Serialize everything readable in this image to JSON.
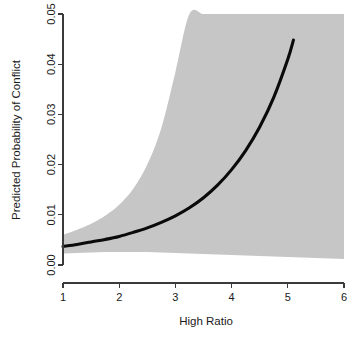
{
  "chart_data": {
    "type": "line",
    "title": "",
    "subtitle": "",
    "xlabel": "High Ratio",
    "ylabel": "Predicted Probability of Conflict",
    "xlim": [
      1,
      6
    ],
    "ylim": [
      0,
      0.05
    ],
    "grid": false,
    "legend": null,
    "legend_position": "none",
    "xticks": [
      1,
      2,
      3,
      4,
      5,
      6
    ],
    "xtick_labels": [
      "1",
      "2",
      "3",
      "4",
      "5",
      "6"
    ],
    "yticks": [
      0.0,
      0.01,
      0.02,
      0.03,
      0.04,
      0.05
    ],
    "ytick_labels": [
      "0.00",
      "0.01",
      "0.02",
      "0.03",
      "0.04",
      "0.05"
    ],
    "ytick_label_rotation": -90,
    "colors": {
      "line": "#0a0a0a",
      "band": "#c6c6c6",
      "axis": "#3a3a3a",
      "text": "#1a1a1a",
      "background": "#ffffff"
    },
    "series": [
      {
        "name": "Predicted probability",
        "type": "line",
        "x": [
          1.0,
          1.25,
          1.5,
          1.75,
          2.0,
          2.25,
          2.5,
          2.75,
          3.0,
          3.25,
          3.5,
          3.75,
          4.0,
          4.25,
          4.5,
          4.75,
          5.0,
          5.1
        ],
        "y": [
          0.0037,
          0.0041,
          0.0046,
          0.0051,
          0.0057,
          0.0065,
          0.0074,
          0.0085,
          0.0098,
          0.0114,
          0.0134,
          0.0159,
          0.019,
          0.0228,
          0.0275,
          0.0334,
          0.041,
          0.0448
        ]
      },
      {
        "name": "95% confidence interval - upper",
        "type": "band_upper",
        "x": [
          1.0,
          1.25,
          1.5,
          1.75,
          2.0,
          2.25,
          2.5,
          2.75,
          3.0,
          3.25,
          3.5,
          3.75,
          4.0,
          4.25,
          4.5,
          4.75,
          5.0,
          5.5,
          6.0
        ],
        "y": [
          0.006,
          0.007,
          0.0082,
          0.0098,
          0.012,
          0.0152,
          0.02,
          0.0273,
          0.0384,
          0.05,
          0.05,
          0.05,
          0.05,
          0.05,
          0.05,
          0.05,
          0.05,
          0.05,
          0.05
        ]
      },
      {
        "name": "95% confidence interval - lower",
        "type": "band_lower",
        "x": [
          1.0,
          1.25,
          1.5,
          1.75,
          2.0,
          2.25,
          2.5,
          2.75,
          3.0,
          3.25,
          3.5,
          3.75,
          4.0,
          4.25,
          4.5,
          4.75,
          5.0,
          5.5,
          6.0
        ],
        "y": [
          0.0023,
          0.0024,
          0.0025,
          0.0026,
          0.0026,
          0.0026,
          0.0026,
          0.0025,
          0.0024,
          0.0023,
          0.0022,
          0.0021,
          0.002,
          0.0019,
          0.0018,
          0.0017,
          0.0016,
          0.0014,
          0.0012
        ]
      }
    ]
  },
  "axes": {
    "x_title": "High Ratio",
    "y_title": "Predicted Probability of Conflict"
  }
}
